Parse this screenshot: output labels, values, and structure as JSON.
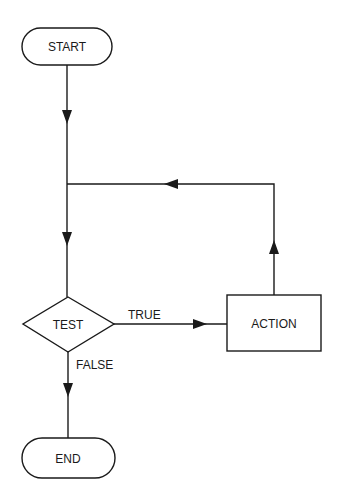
{
  "diagram": {
    "type": "flowchart",
    "nodes": {
      "start": {
        "label": "START",
        "shape": "terminator"
      },
      "test": {
        "label": "TEST",
        "shape": "decision"
      },
      "action": {
        "label": "ACTION",
        "shape": "process"
      },
      "end": {
        "label": "END",
        "shape": "terminator"
      }
    },
    "edges": {
      "true_label": "TRUE",
      "false_label": "FALSE"
    },
    "colors": {
      "stroke": "#1a1a1a",
      "background": "#ffffff"
    }
  }
}
